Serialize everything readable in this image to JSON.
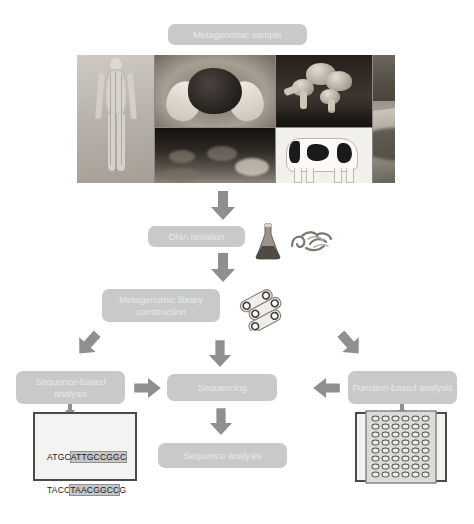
{
  "diagram": {
    "palette": {
      "box_fill": "#c9c9c9",
      "box_text": "#e8e8e8",
      "arrow_fill": "#8f8f8f",
      "frame_border": "#4a4a4a",
      "page_background": "#ffffff"
    }
  },
  "steps": {
    "sample": {
      "label": "Metagenomic sample"
    },
    "dna_isolation": {
      "label": "DNA isolation"
    },
    "library": {
      "label": "Metagenomic library construction"
    },
    "sequence_based": {
      "label": "Sequence-based analysis"
    },
    "sequencing": {
      "label": "Sequencing"
    },
    "function_based": {
      "label": "Function-based analysis"
    },
    "sequence_analysis": {
      "label": "Sequence analysis"
    }
  },
  "collage": {
    "images": [
      {
        "name": "human-body-acupuncture-figure",
        "caption": "Human body"
      },
      {
        "name": "hands-holding-soil",
        "caption": "Soil sample in hands"
      },
      {
        "name": "sediment-underwater",
        "caption": "Sediment"
      },
      {
        "name": "mushrooms-fungi",
        "caption": "Fungi"
      },
      {
        "name": "holstein-cow",
        "caption": "Cow"
      },
      {
        "name": "river-stream-landscape",
        "caption": "Freshwater stream"
      }
    ]
  },
  "icons": {
    "flask": "conical-flask-icon",
    "dna": "dna-strands-icon",
    "plasmid": "plasmid-clones-icon"
  },
  "arrows": [
    {
      "name": "arrow-sample-to-dna",
      "direction": "down"
    },
    {
      "name": "arrow-dna-to-library",
      "direction": "down"
    },
    {
      "name": "arrow-library-to-sequence-based",
      "direction": "down-left"
    },
    {
      "name": "arrow-library-to-sequencing",
      "direction": "down"
    },
    {
      "name": "arrow-library-to-function-based",
      "direction": "down-right"
    },
    {
      "name": "arrow-sequence-based-to-sequencing",
      "direction": "right"
    },
    {
      "name": "arrow-function-based-to-sequencing",
      "direction": "left"
    },
    {
      "name": "arrow-sequence-based-to-gel",
      "direction": "down"
    },
    {
      "name": "arrow-sequencing-to-analysis",
      "direction": "down"
    },
    {
      "name": "arrow-function-based-to-array",
      "direction": "down"
    }
  ],
  "results": {
    "sequence_panel": {
      "name": "dna-sequence-readout",
      "lines": [
        {
          "prefix": "ATGC",
          "highlight": "ATTGCCGGC",
          "suffix": ""
        },
        {
          "prefix": "TACC",
          "highlight": "TAACGGCC",
          "suffix": "G"
        }
      ]
    },
    "microarray_panel": {
      "name": "microarray-plate",
      "columns": 6,
      "rows": 8,
      "well_count": 48
    }
  }
}
